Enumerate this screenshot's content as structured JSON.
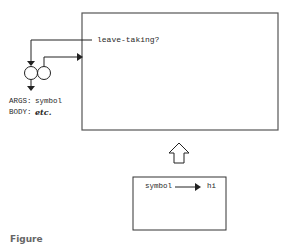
{
  "diagram": {
    "main_box": {
      "question_label": "leave-taking?"
    },
    "method": {
      "args_key": "ARGS:",
      "args_value": "symbol",
      "body_key": "BODY:",
      "body_value": "etc."
    },
    "lower_box": {
      "source_label": "symbol",
      "target_label": "hi"
    },
    "caption": "Figure"
  }
}
